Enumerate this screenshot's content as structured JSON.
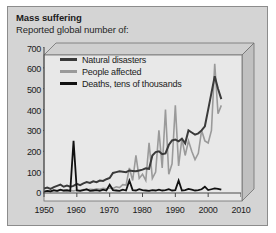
{
  "title": "Mass suffering",
  "subtitle": "Reported global number of:",
  "colors": {
    "panel": "#d4d4d4",
    "plot_bg": "#e8e8e8",
    "natural_disasters": "#3a3a3a",
    "people_affected": "#9a9a9a",
    "deaths": "#111111",
    "axis": "#4a4a4a",
    "box_side": "#c0c0c0",
    "box_top": "#cfcfcf"
  },
  "legend": {
    "position": "top-left-inside",
    "items": [
      {
        "label": "Natural disasters",
        "color": "#3a3a3a",
        "swatch": "line-swatch"
      },
      {
        "label": "People affected",
        "color": "#9a9a9a",
        "swatch": "line-swatch"
      },
      {
        "label": "Deaths, tens of thousands",
        "color": "#111111",
        "swatch": "line-swatch"
      }
    ]
  },
  "axes": {
    "y_ticks": [
      "700",
      "600",
      "500",
      "400",
      "300",
      "200",
      "100",
      "0"
    ],
    "x_ticks": [
      "1950",
      "1960",
      "1970",
      "1980",
      "1990",
      "2000",
      "2010"
    ]
  },
  "chart_data": {
    "type": "line",
    "title": "Mass suffering",
    "subtitle": "Reported global number of:",
    "xlabel": "",
    "ylabel": "",
    "xlim": [
      1950,
      2010
    ],
    "ylim": [
      0,
      700
    ],
    "grid": false,
    "legend_position": "upper left (inside plot)",
    "x": [
      1950,
      1951,
      1952,
      1953,
      1954,
      1955,
      1956,
      1957,
      1958,
      1959,
      1960,
      1961,
      1962,
      1963,
      1964,
      1965,
      1966,
      1967,
      1968,
      1969,
      1970,
      1971,
      1972,
      1973,
      1974,
      1975,
      1976,
      1977,
      1978,
      1979,
      1980,
      1981,
      1982,
      1983,
      1984,
      1985,
      1986,
      1987,
      1988,
      1989,
      1990,
      1991,
      1992,
      1993,
      1994,
      1995,
      1996,
      1997,
      1998,
      1999,
      2000,
      2001,
      2002,
      2003,
      2004
    ],
    "series": [
      {
        "name": "Natural disasters",
        "color": "#3a3a3a",
        "values": [
          22,
          26,
          20,
          28,
          34,
          40,
          30,
          36,
          30,
          34,
          44,
          38,
          46,
          52,
          48,
          56,
          52,
          60,
          58,
          66,
          72,
          96,
          100,
          104,
          102,
          100,
          108,
          106,
          104,
          108,
          112,
          118,
          116,
          180,
          196,
          200,
          186,
          190,
          230,
          252,
          256,
          248,
          260,
          238,
          300,
          290,
          280,
          286,
          300,
          320,
          400,
          480,
          560,
          500,
          450
        ]
      },
      {
        "name": "People affected",
        "color": "#9a9a9a",
        "values": [
          8,
          10,
          6,
          12,
          8,
          14,
          10,
          8,
          12,
          10,
          14,
          12,
          16,
          14,
          18,
          16,
          20,
          18,
          22,
          20,
          24,
          22,
          30,
          26,
          40,
          38,
          120,
          60,
          180,
          70,
          90,
          60,
          240,
          70,
          100,
          300,
          120,
          400,
          90,
          140,
          420,
          130,
          260,
          180,
          250,
          200,
          160,
          190,
          300,
          250,
          240,
          300,
          620,
          380,
          420
        ]
      },
      {
        "name": "Deaths, tens of thousands",
        "color": "#111111",
        "values": [
          6,
          10,
          8,
          14,
          10,
          16,
          12,
          14,
          10,
          250,
          12,
          10,
          14,
          18,
          10,
          12,
          14,
          10,
          16,
          12,
          40,
          14,
          12,
          10,
          16,
          12,
          60,
          14,
          12,
          18,
          14,
          12,
          10,
          14,
          12,
          16,
          12,
          14,
          18,
          12,
          14,
          60,
          12,
          14,
          20,
          16,
          12,
          14,
          18,
          30,
          14,
          18,
          22,
          20,
          16
        ]
      }
    ]
  }
}
